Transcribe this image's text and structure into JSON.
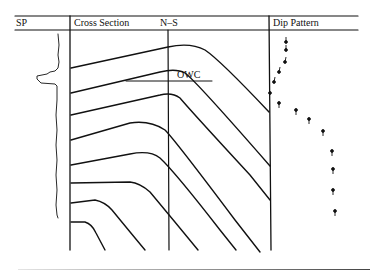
{
  "figure": {
    "columns": {
      "sp": "SP",
      "cross_section": "Cross Section",
      "orientation": "N–S",
      "dip_pattern": "Dip Pattern"
    },
    "annotations": {
      "owc": "OWC"
    },
    "colors": {
      "ink": "#111111",
      "background": "#ffffff"
    },
    "dip_pattern": {
      "upper_dips": "decreasing dips, arrows pointing down (south)",
      "lower_dips": "increasing dips, tadpoles pointing up (north)",
      "count_upper": 6,
      "count_lower": 9
    }
  }
}
